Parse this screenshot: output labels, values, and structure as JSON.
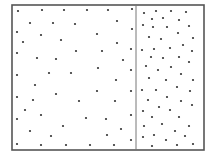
{
  "diagram": {
    "type": "particle-container",
    "colors": {
      "background": "#ffffff",
      "border": "#555555",
      "divider": "#777777",
      "particle": "#333333"
    },
    "box": {
      "x": 12,
      "y": 5,
      "width": 192,
      "height": 145
    },
    "divider_x": 136,
    "particle_radius": 1.1,
    "chambers": [
      {
        "name": "left-chamber",
        "density": "low",
        "particles": [
          [
            18,
            11
          ],
          [
            42,
            10
          ],
          [
            64,
            10
          ],
          [
            87,
            10
          ],
          [
            108,
            10
          ],
          [
            132,
            9
          ],
          [
            117,
            21
          ],
          [
            30,
            23
          ],
          [
            53,
            23
          ],
          [
            75,
            24
          ],
          [
            17,
            32
          ],
          [
            41,
            35
          ],
          [
            97,
            34
          ],
          [
            132,
            29
          ],
          [
            23,
            42
          ],
          [
            61,
            40
          ],
          [
            117,
            43
          ],
          [
            17,
            53
          ],
          [
            76,
            51
          ],
          [
            102,
            51
          ],
          [
            131,
            49
          ],
          [
            37,
            58
          ],
          [
            56,
            59
          ],
          [
            123,
            60
          ],
          [
            98,
            68
          ],
          [
            131,
            70
          ],
          [
            17,
            75
          ],
          [
            49,
            73
          ],
          [
            71,
            73
          ],
          [
            116,
            80
          ],
          [
            35,
            85
          ],
          [
            97,
            91
          ],
          [
            131,
            91
          ],
          [
            56,
            94
          ],
          [
            17,
            97
          ],
          [
            33,
            100
          ],
          [
            79,
            101
          ],
          [
            115,
            101
          ],
          [
            25,
            110
          ],
          [
            41,
            115
          ],
          [
            131,
            115
          ],
          [
            86,
            118
          ],
          [
            106,
            119
          ],
          [
            17,
            119
          ],
          [
            63,
            126
          ],
          [
            121,
            129
          ],
          [
            30,
            131
          ],
          [
            51,
            136
          ],
          [
            107,
            135
          ],
          [
            131,
            140
          ],
          [
            17,
            144
          ],
          [
            41,
            145
          ],
          [
            66,
            145
          ],
          [
            90,
            145
          ],
          [
            114,
            145
          ]
        ]
      },
      {
        "name": "right-chamber",
        "density": "high",
        "particles": [
          [
            144,
            13
          ],
          [
            156,
            11
          ],
          [
            171,
            11
          ],
          [
            186,
            12
          ],
          [
            152,
            19
          ],
          [
            163,
            18
          ],
          [
            179,
            20
          ],
          [
            143,
            25
          ],
          [
            153,
            27
          ],
          [
            167,
            27
          ],
          [
            189,
            26
          ],
          [
            149,
            37
          ],
          [
            161,
            39
          ],
          [
            178,
            33
          ],
          [
            193,
            38
          ],
          [
            142,
            50
          ],
          [
            154,
            49
          ],
          [
            170,
            48
          ],
          [
            183,
            45
          ],
          [
            192,
            51
          ],
          [
            151,
            57
          ],
          [
            163,
            58
          ],
          [
            179,
            57
          ],
          [
            189,
            62
          ],
          [
            146,
            66
          ],
          [
            158,
            70
          ],
          [
            171,
            67
          ],
          [
            181,
            74
          ],
          [
            149,
            78
          ],
          [
            166,
            80
          ],
          [
            193,
            80
          ],
          [
            142,
            90
          ],
          [
            156,
            90
          ],
          [
            177,
            87
          ],
          [
            190,
            91
          ],
          [
            148,
            100
          ],
          [
            167,
            97
          ],
          [
            181,
            101
          ],
          [
            192,
            105
          ],
          [
            143,
            111
          ],
          [
            159,
            107
          ],
          [
            170,
            110
          ],
          [
            152,
            117
          ],
          [
            179,
            117
          ],
          [
            144,
            126
          ],
          [
            162,
            124
          ],
          [
            189,
            126
          ],
          [
            175,
            131
          ],
          [
            143,
            137
          ],
          [
            154,
            135
          ],
          [
            166,
            140
          ],
          [
            185,
            136
          ],
          [
            193,
            144
          ],
          [
            152,
            146
          ],
          [
            177,
            145
          ]
        ]
      }
    ]
  }
}
